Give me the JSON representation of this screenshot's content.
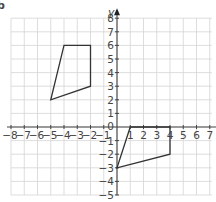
{
  "part_label": "b",
  "chart_data": {
    "type": "scatter",
    "title": "",
    "xlabel": "",
    "ylabel": "y",
    "xlim": [
      -8,
      7
    ],
    "ylim": [
      -5,
      8
    ],
    "grid": true,
    "x_ticks": [
      -8,
      -7,
      -6,
      -5,
      -4,
      -3,
      -2,
      -1,
      0,
      1,
      2,
      3,
      4,
      5,
      6,
      7
    ],
    "y_ticks": [
      -5,
      -4,
      -3,
      -2,
      -1,
      1,
      2,
      3,
      4,
      5,
      6,
      7,
      8
    ],
    "origin_label": "0",
    "shapes": [
      {
        "name": "quadrilateral-upper-left",
        "points": [
          [
            -4,
            6
          ],
          [
            -2,
            6
          ],
          [
            -2,
            3
          ],
          [
            -5,
            2
          ]
        ]
      },
      {
        "name": "quadrilateral-lower-right",
        "points": [
          [
            1,
            0
          ],
          [
            4,
            0
          ],
          [
            4,
            -2
          ],
          [
            0,
            -3
          ]
        ]
      }
    ],
    "colors": {
      "grid": "#d4d4d4",
      "axis": "#444444",
      "shape": "#333333"
    }
  }
}
